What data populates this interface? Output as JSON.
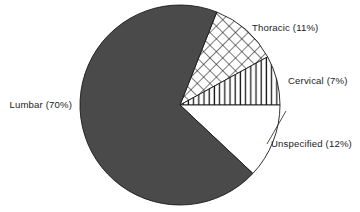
{
  "chart_data": {
    "type": "pie",
    "title": "",
    "subtitle": "",
    "xlabel": "",
    "ylabel": "",
    "grid": false,
    "legend_position": "none",
    "labels_inline": true,
    "total_percent": 100,
    "categories": [
      "Lumbar",
      "Thoracic",
      "Cervical",
      "Unspecified"
    ],
    "values": [
      70,
      11,
      7,
      12
    ],
    "value_unit": "%",
    "slices": [
      {
        "name": "Thoracic",
        "value": 11,
        "label": "Thoracic (11%)",
        "fill_style": "cross-hatch",
        "fill_color": "#ffffff",
        "pattern_color": "#1a1a1a",
        "start_deg": -68.4,
        "end_deg": -28.8,
        "label_anchor": "start",
        "label_x": 252,
        "label_y": 31,
        "has_leader": false
      },
      {
        "name": "Cervical",
        "value": 7,
        "label": "Cervical (7%)",
        "fill_style": "vertical-lines",
        "fill_color": "#ffffff",
        "pattern_color": "#1a1a1a",
        "start_deg": -28.8,
        "end_deg": 0.0,
        "label_anchor": "start",
        "label_x": 288,
        "label_y": 84,
        "has_leader": false
      },
      {
        "name": "Unspecified",
        "value": 12,
        "label": "Unspecified (12%)",
        "fill_style": "solid",
        "fill_color": "#ffffff",
        "pattern_color": "#1a1a1a",
        "start_deg": 0.0,
        "end_deg": 43.2,
        "label_anchor": "start",
        "label_x": 271,
        "label_y": 147,
        "has_leader": true,
        "leader_x1": 286,
        "leader_y1": 111,
        "leader_x2": 267,
        "leader_y2": 144
      },
      {
        "name": "Lumbar",
        "value": 70,
        "label": "Lumbar (70%)",
        "fill_style": "solid",
        "fill_color": "#4a4a4a",
        "pattern_color": "#4a4a4a",
        "start_deg": 43.2,
        "end_deg": 291.6,
        "label_anchor": "end",
        "label_x": 72,
        "label_y": 108,
        "has_leader": false
      }
    ],
    "geometry": {
      "center_x": 180,
      "center_y": 105,
      "radius": 100
    },
    "colors": {
      "background": "#ffffff",
      "outline": "#1a1a1a",
      "lumbar_fill": "#4a4a4a",
      "text": "#1c1c1c",
      "leader": "#3a3a3a"
    }
  }
}
